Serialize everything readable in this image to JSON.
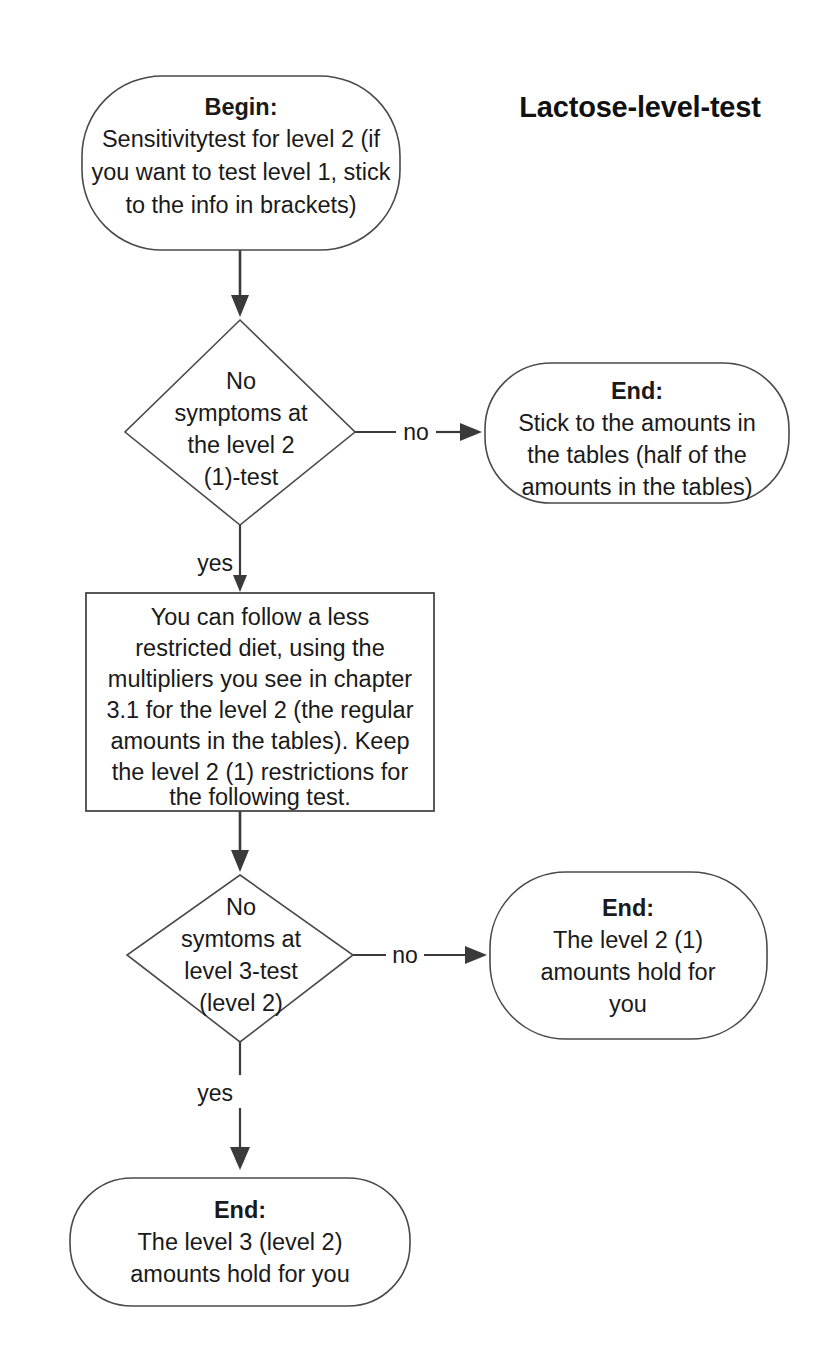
{
  "title": "Lactose-level-test",
  "nodes": {
    "begin": {
      "shape": "rounded",
      "lead": "Begin:",
      "lines": [
        "Sensitivitytest for level 2 (if",
        "you want to test level 1, stick",
        "to the info in brackets)"
      ]
    },
    "decision1": {
      "shape": "diamond",
      "lines": [
        "No",
        "symptoms at",
        "the level 2",
        "(1)-test"
      ]
    },
    "end1": {
      "shape": "rounded",
      "lead": "End:",
      "lines": [
        "Stick to the amounts in",
        "the tables (half of the",
        "amounts in the tables)"
      ]
    },
    "process1": {
      "shape": "rectangle",
      "lines": [
        "You can follow a less",
        "restricted diet, using the",
        "multipliers you see in chapter",
        "3.1 for the level 2 (the regular",
        "amounts in the tables). Keep",
        "the level 2 (1) restrictions for",
        "the following test."
      ]
    },
    "decision2": {
      "shape": "diamond",
      "lines": [
        "No",
        "symtoms at",
        "level 3-test",
        "(level 2)"
      ]
    },
    "end2": {
      "shape": "rounded",
      "lead": "End:",
      "lines": [
        "The level 2 (1)",
        "amounts hold for",
        "you"
      ]
    },
    "end3": {
      "shape": "rounded",
      "lead": "End:",
      "lines": [
        "The level 3 (level 2)",
        "amounts hold for you"
      ]
    }
  },
  "edges": {
    "begin_to_decision1": {
      "label": ""
    },
    "decision1_no": {
      "label": "no"
    },
    "decision1_yes": {
      "label": "yes"
    },
    "process1_to_decision2": {
      "label": ""
    },
    "decision2_no": {
      "label": "no"
    },
    "decision2_yes": {
      "label": "yes"
    }
  },
  "colors": {
    "stroke": "#3a3a3a",
    "text": "#1a1a1a",
    "background": "#ffffff"
  }
}
